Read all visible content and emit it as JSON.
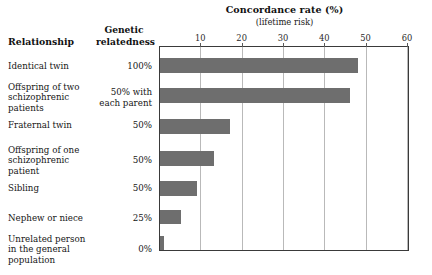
{
  "columns": {
    "relationship_header": "Relationship",
    "genetic_header_line1": "Genetic",
    "genetic_header_line2": "relatedness"
  },
  "chart_data": {
    "type": "bar",
    "orientation": "horizontal",
    "title": "Concordance rate (%)",
    "subtitle": "(lifetime risk)",
    "xlabel": "Concordance rate (%)",
    "ylabel": "Relationship",
    "xlim": [
      0,
      60.5
    ],
    "xticks": [
      10,
      20,
      30,
      40,
      50,
      60
    ],
    "xtick_labels": [
      "10",
      "20",
      "30",
      "40",
      "50",
      "60"
    ],
    "grid": "vertical",
    "legend": "none",
    "bar_color": "#6e6e6e",
    "categories": [
      "Identical twin",
      "Offspring of two schizophrenic patients",
      "Fraternal twin",
      "Offspring of one schizophrenic patient",
      "Sibling",
      "Nephew or niece",
      "Unrelated person in the general population"
    ],
    "values": [
      48,
      46,
      17,
      13,
      9,
      5,
      1
    ],
    "genetic_relatedness": [
      "100%",
      "50% with each parent",
      "50%",
      "50%",
      "50%",
      "25%",
      "0%"
    ]
  },
  "rows": [
    {
      "label_lines": [
        "Identical twin"
      ],
      "relatedness_lines": [
        "100%"
      ],
      "value": 48,
      "label_top": 61,
      "bar_top": 57,
      "bar_height": 15
    },
    {
      "label_lines": [
        "Offspring of two",
        "schizophrenic",
        "patients"
      ],
      "relatedness_lines": [
        "50% with",
        "each parent"
      ],
      "value": 46,
      "label_top": 82,
      "bar_top": 87,
      "bar_height": 15
    },
    {
      "label_lines": [
        "Fraternal twin"
      ],
      "relatedness_lines": [
        "50%"
      ],
      "value": 17,
      "label_top": 120,
      "bar_top": 118,
      "bar_height": 15
    },
    {
      "label_lines": [
        "Offspring of one",
        "schizophrenic",
        "patient"
      ],
      "relatedness_lines": [
        "50%"
      ],
      "value": 13,
      "label_top": 145,
      "bar_top": 150,
      "bar_height": 15
    },
    {
      "label_lines": [
        "Sibling"
      ],
      "relatedness_lines": [
        "50%"
      ],
      "value": 9,
      "label_top": 183,
      "bar_top": 180,
      "bar_height": 15
    },
    {
      "label_lines": [
        "Nephew or niece"
      ],
      "relatedness_lines": [
        "25%"
      ],
      "value": 5,
      "label_top": 213,
      "bar_top": 209,
      "bar_height": 14
    },
    {
      "label_lines": [
        "Unrelated person",
        "in the general",
        "population"
      ],
      "relatedness_lines": [
        "0%"
      ],
      "value": 1,
      "label_top": 234,
      "bar_top": 235,
      "bar_height": 14
    }
  ],
  "plot_geometry": {
    "left": 159,
    "top": 46,
    "width": 250,
    "height": 205,
    "x_max": 60.5
  }
}
